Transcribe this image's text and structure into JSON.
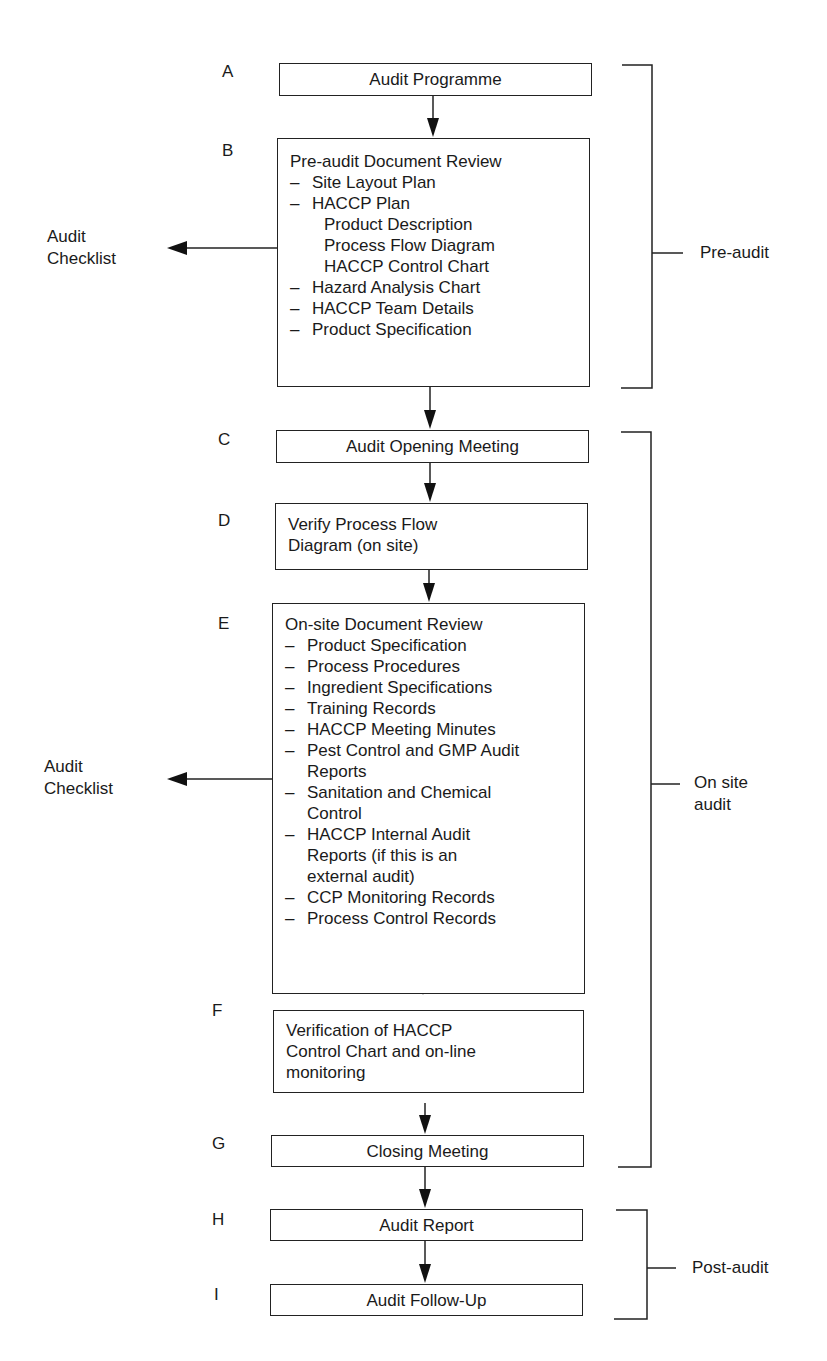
{
  "diagram": {
    "type": "flowchart",
    "steps": [
      {
        "letter": "A",
        "title": "Audit Programme"
      },
      {
        "letter": "B",
        "title": "Pre-audit Document Review",
        "items": [
          {
            "text": "Site Layout Plan",
            "dash": "–"
          },
          {
            "text": "HACCP Plan",
            "dash": "–"
          },
          {
            "text": "Product Description",
            "sub": true
          },
          {
            "text": "Process Flow Diagram",
            "sub": true
          },
          {
            "text": "HACCP Control Chart",
            "sub": true
          },
          {
            "text": "Hazard Analysis Chart",
            "dash": "–"
          },
          {
            "text": "HACCP Team Details",
            "dash": "–"
          },
          {
            "text": "Product Specification",
            "dash": "–"
          }
        ]
      },
      {
        "letter": "C",
        "title": "Audit Opening Meeting"
      },
      {
        "letter": "D",
        "title_line1": "Verify Process Flow",
        "title_line2": "Diagram (on site)"
      },
      {
        "letter": "E",
        "title": "On-site Document Review",
        "items": [
          {
            "text": "Product Specification",
            "dash": "–"
          },
          {
            "text": "Process Procedures",
            "dash": "–"
          },
          {
            "text": "Ingredient Specifications",
            "dash": "–"
          },
          {
            "text": "Training Records",
            "dash": "–"
          },
          {
            "text": "HACCP Meeting Minutes",
            "dash": "–"
          },
          {
            "text": "Pest Control and GMP Audit",
            "dash": "–"
          },
          {
            "text": "Reports",
            "cont": true
          },
          {
            "text": "Sanitation and Chemical",
            "dash": "–"
          },
          {
            "text": "Control",
            "cont": true
          },
          {
            "text": "HACCP Internal Audit",
            "dash": "–"
          },
          {
            "text": "Reports (if this is an",
            "cont": true
          },
          {
            "text": "external audit)",
            "cont": true
          },
          {
            "text": "CCP Monitoring Records",
            "dash": "–"
          },
          {
            "text": "Process Control Records",
            "dash": "–"
          }
        ]
      },
      {
        "letter": "F",
        "title_line1": "Verification of HACCP",
        "title_line2": "Control Chart and on-line",
        "title_line3": "monitoring"
      },
      {
        "letter": "G",
        "title": "Closing Meeting"
      },
      {
        "letter": "H",
        "title": "Audit Report"
      },
      {
        "letter": "I",
        "title": "Audit Follow-Up"
      }
    ],
    "side_outputs": [
      {
        "line1": "Audit",
        "line2": "Checklist",
        "from_step": "B"
      },
      {
        "line1": "Audit",
        "line2": "Checklist",
        "from_step": "E"
      }
    ],
    "phases": [
      {
        "label": "Pre-audit",
        "steps": [
          "A",
          "B"
        ]
      },
      {
        "label_line1": "On site",
        "label_line2": "audit",
        "steps": [
          "C",
          "D",
          "E",
          "F",
          "G"
        ]
      },
      {
        "label": "Post-audit",
        "steps": [
          "H",
          "I"
        ]
      }
    ],
    "colors": {
      "line": "#222222",
      "background": "#ffffff",
      "text": "#1a1a1a"
    }
  }
}
